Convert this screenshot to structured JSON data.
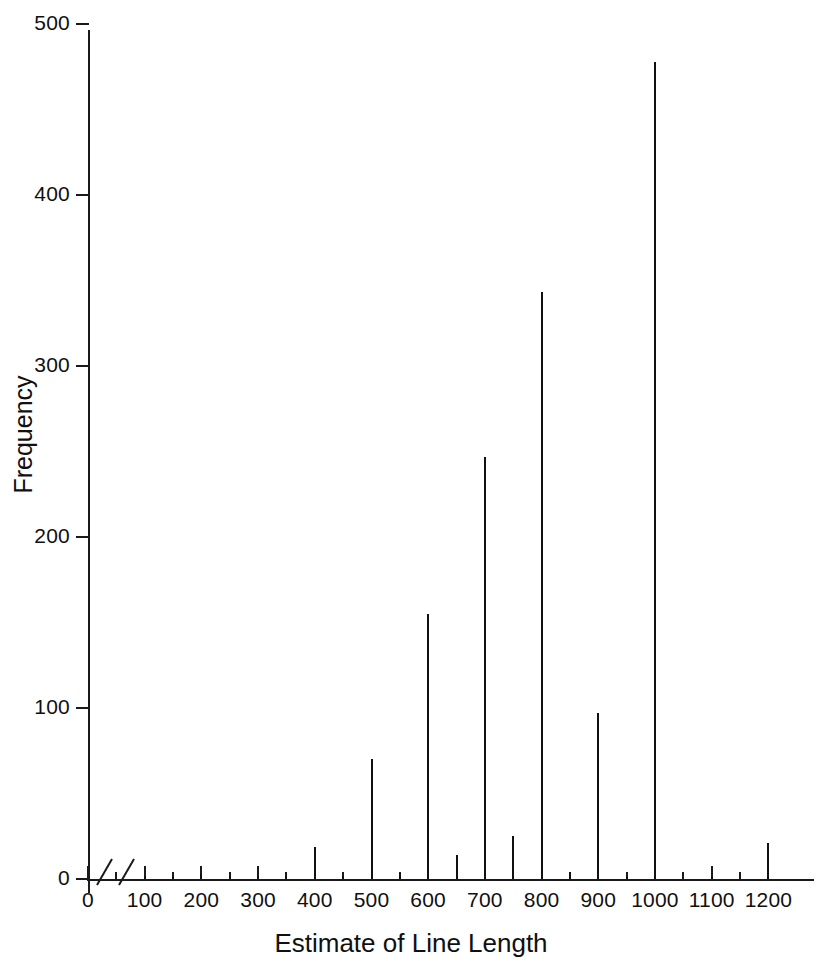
{
  "chart_data": {
    "type": "bar",
    "title": "",
    "subtitle": "",
    "xlabel": "Estimate of Line Length",
    "ylabel": "Frequency",
    "xlim": [
      0,
      1250
    ],
    "ylim": [
      0,
      500
    ],
    "grid": false,
    "legend": null,
    "x_ticks": [
      0,
      100,
      200,
      300,
      400,
      500,
      600,
      700,
      800,
      900,
      1000,
      1100,
      1200
    ],
    "x_tick_labels": [
      "0",
      "100",
      "200",
      "300",
      "400",
      "500",
      "600",
      "700",
      "800",
      "900",
      "1000",
      "1100",
      "1200"
    ],
    "x_minor_ticks": [
      50,
      150,
      250,
      350,
      450,
      550,
      650,
      750,
      850,
      950,
      1050,
      1150
    ],
    "y_ticks": [
      0,
      100,
      200,
      300,
      400,
      500
    ],
    "y_tick_labels": [
      "0",
      "100",
      "200",
      "300",
      "400",
      "500"
    ],
    "axis_break": true,
    "axis_break_note": "broken-axis slash marks between 0 and 100 on x-axis",
    "x": [
      100,
      150,
      200,
      250,
      300,
      350,
      400,
      450,
      500,
      550,
      600,
      650,
      700,
      750,
      800,
      850,
      900,
      950,
      1000,
      1100,
      1200
    ],
    "values": [
      2,
      2,
      3,
      2,
      2,
      2,
      19,
      2,
      70,
      3,
      155,
      14,
      247,
      25,
      343,
      4,
      97,
      2,
      478,
      2,
      21
    ],
    "series": [
      {
        "name": "Frequency",
        "color": "#111111",
        "points": [
          {
            "x": 100,
            "y": 2
          },
          {
            "x": 150,
            "y": 2
          },
          {
            "x": 200,
            "y": 3
          },
          {
            "x": 250,
            "y": 2
          },
          {
            "x": 300,
            "y": 2
          },
          {
            "x": 350,
            "y": 2
          },
          {
            "x": 400,
            "y": 19
          },
          {
            "x": 450,
            "y": 2
          },
          {
            "x": 500,
            "y": 70
          },
          {
            "x": 550,
            "y": 3
          },
          {
            "x": 600,
            "y": 155
          },
          {
            "x": 650,
            "y": 14
          },
          {
            "x": 700,
            "y": 247
          },
          {
            "x": 750,
            "y": 25
          },
          {
            "x": 800,
            "y": 343
          },
          {
            "x": 850,
            "y": 4
          },
          {
            "x": 900,
            "y": 97
          },
          {
            "x": 950,
            "y": 2
          },
          {
            "x": 1000,
            "y": 478
          },
          {
            "x": 1100,
            "y": 2
          },
          {
            "x": 1200,
            "y": 21
          }
        ]
      }
    ],
    "colors": {
      "axis": "#1a1a1a",
      "spike": "#111111",
      "text": "#101010",
      "background": "#ffffff"
    }
  }
}
